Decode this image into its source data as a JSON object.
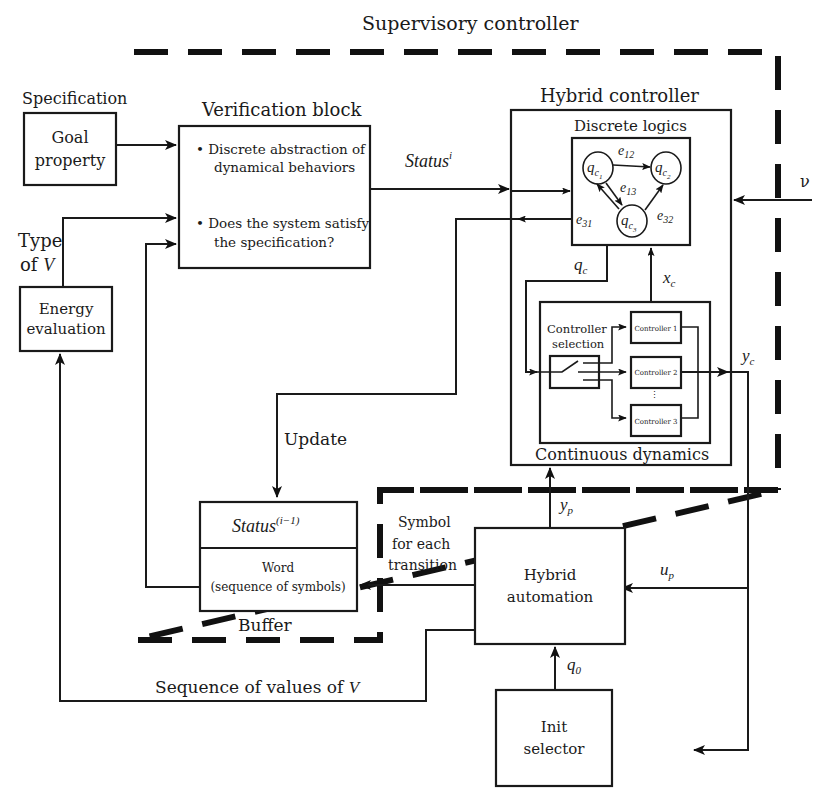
{
  "diagram": {
    "title": "Supervisory controller",
    "colors": {
      "line": "#1a1a1a",
      "background": "#ffffff"
    },
    "regions": {
      "supervisory": "Supervisory controller",
      "buffer": "Buffer"
    },
    "blocks": {
      "goal": {
        "heading": "Specification",
        "line1": "Goal",
        "line2": "property"
      },
      "verification": {
        "heading": "Verification block",
        "bullet1_line1": "• Discrete abstraction of",
        "bullet1_line2": "dynamical behaviors",
        "bullet2_line1": "• Does the system satisfy",
        "bullet2_line2": "the specification?"
      },
      "energy": {
        "line1": "Energy",
        "line2": "evaluation"
      },
      "hybrid_controller": {
        "heading": "Hybrid controller",
        "discrete_heading": "Discrete logics",
        "continuous_heading": "Continuous dynamics",
        "controller_selection_line1": "Controller",
        "controller_selection_line2": "selection",
        "controllers": [
          "Controller 1",
          "Controller 2",
          "Controller 3"
        ],
        "states": [
          {
            "base": "q",
            "sub": "c",
            "subsub": "1"
          },
          {
            "base": "q",
            "sub": "c",
            "subsub": "2"
          },
          {
            "base": "q",
            "sub": "c",
            "subsub": "3"
          }
        ],
        "edges": [
          {
            "base": "e",
            "sub": "12"
          },
          {
            "base": "e",
            "sub": "13"
          },
          {
            "base": "e",
            "sub": "31"
          },
          {
            "base": "e",
            "sub": "32"
          }
        ]
      },
      "buffer": {
        "status_base": "Status",
        "status_sup": "(i−1)",
        "word_line1": "Word",
        "word_line2": "(sequence of symbols)"
      },
      "hybrid_automation": {
        "line1": "Hybrid",
        "line2": "automation"
      },
      "init_selector": {
        "line1": "Init",
        "line2": "selector"
      }
    },
    "signals": {
      "status_i_base": "Status",
      "status_i_sup": "i",
      "type_of_v_line1": "Type",
      "type_of_v_line2_pre": "of ",
      "type_of_v_line2_var": "V",
      "update": "Update",
      "symbol_line1": "Symbol",
      "symbol_line2": "for each",
      "symbol_line3": "transition",
      "sequence_pre": "Sequence of values of ",
      "sequence_var": "V",
      "nu": "ν",
      "qc_base": "q",
      "qc_sub": "c",
      "xc_base": "x",
      "xc_sub": "c",
      "yc_base": "y",
      "yc_sub": "c",
      "yp_base": "y",
      "yp_sub": "p",
      "up_base": "u",
      "up_sub": "p",
      "q0_base": "q",
      "q0_sub": "0"
    }
  }
}
